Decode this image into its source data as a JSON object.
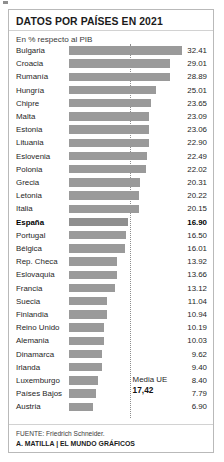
{
  "header": {
    "title": "DATOS POR PAÍSES EN 2021",
    "subtitle": "En % respecto al PIB"
  },
  "footer": {
    "source": "FUENTE: Friedrich Schneider.",
    "credit": "A. MATILLA | EL MUNDO GRÁFICOS"
  },
  "average": {
    "label": "Media UE",
    "value_text": "17,42",
    "value": 17.42
  },
  "colors": {
    "bar": "#9a9a9a",
    "highlight_bar": "#8f8f8f",
    "panel_border": "#b9b9b9",
    "rule": "#d2d2d2",
    "text": "#262626",
    "avg_line": "#8d8d8d"
  },
  "chart_data": {
    "type": "bar",
    "orientation": "horizontal",
    "title": "DATOS POR PAÍSES EN 2021",
    "subtitle": "En % respecto al PIB",
    "xlabel": "",
    "ylabel": "",
    "xlim": [
      0,
      32.41
    ],
    "grid": false,
    "legend": null,
    "annotations": [
      {
        "name": "Media UE",
        "value": 17.42,
        "value_text": "17,42",
        "type": "reference-line"
      }
    ],
    "highlight": "España",
    "categories": [
      "Bulgaria",
      "Croacia",
      "Rumanía",
      "Hungría",
      "Chipre",
      "Malta",
      "Estonia",
      "Lituania",
      "Eslovenia",
      "Polonia",
      "Grecia",
      "Letonia",
      "Italia",
      "España",
      "Portugal",
      "Bélgica",
      "Rep. Checa",
      "Eslovaquia",
      "Francia",
      "Suecia",
      "Finlandia",
      "Reino Unido",
      "Alemania",
      "Dinamarca",
      "Irlanda",
      "Luxemburgo",
      "Países Bajos",
      "Austria"
    ],
    "values": [
      32.41,
      29.01,
      28.89,
      25.01,
      23.65,
      23.09,
      23.06,
      22.9,
      22.49,
      22.02,
      20.31,
      20.22,
      20.15,
      16.9,
      16.5,
      16.01,
      13.92,
      13.66,
      13.12,
      11.04,
      10.94,
      10.19,
      10.03,
      9.62,
      9.4,
      8.4,
      7.79,
      6.9
    ],
    "value_labels": [
      "32.41",
      "29.01",
      "28.89",
      "25.01",
      "23.65",
      "23.09",
      "23.06",
      "22.90",
      "22.49",
      "22.02",
      "20.31",
      "20.22",
      "20.15",
      "16.90",
      "16.50",
      "16.01",
      "13.92",
      "13.66",
      "13.12",
      "11.04",
      "10.94",
      "10.19",
      "10.03",
      "9.62",
      "9.40",
      "8.40",
      "7.79",
      "6.90"
    ]
  }
}
